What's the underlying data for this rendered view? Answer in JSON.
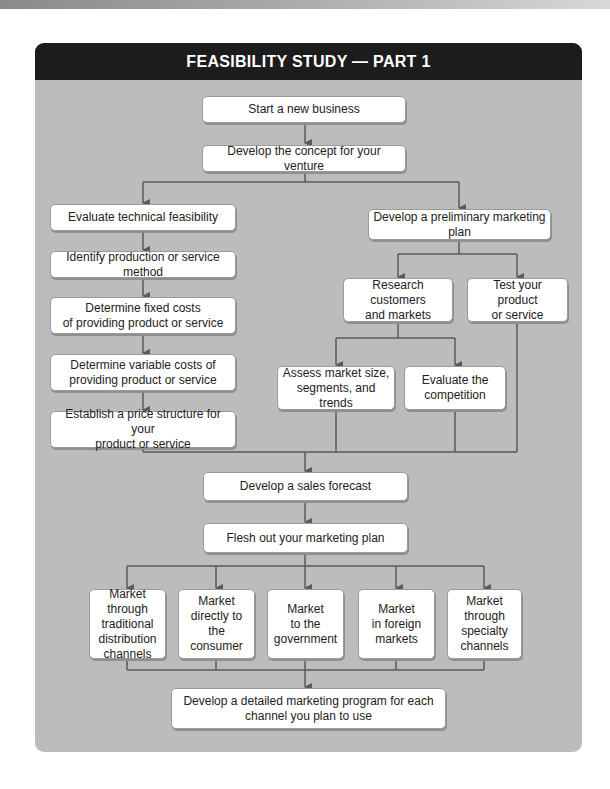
{
  "title": "FEASIBILITY STUDY — PART 1",
  "colors": {
    "panel_bg": "#bcbcbc",
    "header_bg": "#1c1c1c",
    "box_bg": "#ffffff",
    "line": "#5a5a5a"
  },
  "nodes": {
    "start": "Start a new business",
    "concept": "Develop the concept for your venture",
    "tech_feasibility": "Evaluate technical feasibility",
    "production_method": "Identify production or service method",
    "fixed_costs": "Determine fixed costs\nof providing product or service",
    "variable_costs": "Determine variable costs of\nproviding product or service",
    "price_structure": "Establish a price structure for your\nproduct or service",
    "prelim_marketing": "Develop a preliminary marketing plan",
    "research_customers": "Research customers\nand markets",
    "test_product": "Test your product\nor service",
    "assess_market": "Assess market size,\nsegments, and trends",
    "evaluate_competition": "Evaluate the\ncompetition",
    "sales_forecast": "Develop a sales forecast",
    "flesh_out": "Flesh out your marketing plan",
    "channels": [
      "Market through\ntraditional\ndistribution\nchannels",
      "Market\ndirectly to the\nconsumer",
      "Market\nto the\ngovernment",
      "Market\nin foreign\nmarkets",
      "Market through\nspecialty\nchannels"
    ],
    "detailed_program": "Develop a detailed marketing program for each\nchannel you plan to use"
  }
}
